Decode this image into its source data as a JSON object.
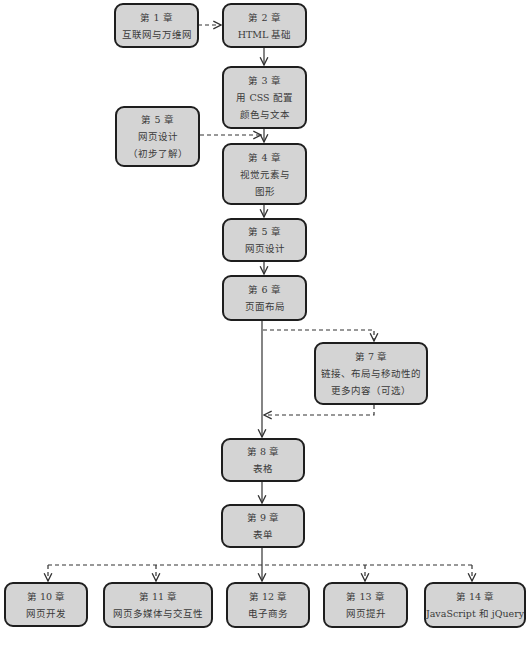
{
  "diagram": {
    "type": "flowchart",
    "colors": {
      "box_fill": "#d4d4d4",
      "box_border": "#1e1e1e",
      "line": "#333333",
      "text": "#3a3a3a"
    },
    "nodes": [
      {
        "id": "ch1",
        "chapter": "第 1 章",
        "lines": [
          "互联网与万维网"
        ]
      },
      {
        "id": "ch2",
        "chapter": "第 2 章",
        "lines": [
          "HTML 基础"
        ]
      },
      {
        "id": "ch3",
        "chapter": "第 3 章",
        "lines": [
          "用 CSS 配置",
          "颜色与文本"
        ]
      },
      {
        "id": "ch5a",
        "chapter": "第 5 章",
        "lines": [
          "网页设计",
          "（初步了解）"
        ]
      },
      {
        "id": "ch4",
        "chapter": "第 4 章",
        "lines": [
          "视觉元素与",
          "图形"
        ]
      },
      {
        "id": "ch5",
        "chapter": "第 5 章",
        "lines": [
          "网页设计"
        ]
      },
      {
        "id": "ch6",
        "chapter": "第 6 章",
        "lines": [
          "页面布局"
        ]
      },
      {
        "id": "ch7",
        "chapter": "第 7 章",
        "lines": [
          "链接、布局与移动性的",
          "更多内容（可选）"
        ]
      },
      {
        "id": "ch8",
        "chapter": "第 8 章",
        "lines": [
          "表格"
        ]
      },
      {
        "id": "ch9",
        "chapter": "第 9 章",
        "lines": [
          "表单"
        ]
      },
      {
        "id": "ch10",
        "chapter": "第 10 章",
        "lines": [
          "网页开发"
        ]
      },
      {
        "id": "ch11",
        "chapter": "第 11 章",
        "lines": [
          "网页多媒体与交互性"
        ]
      },
      {
        "id": "ch12",
        "chapter": "第 12 章",
        "lines": [
          "电子商务"
        ]
      },
      {
        "id": "ch13",
        "chapter": "第 13 章",
        "lines": [
          "网页提升"
        ]
      },
      {
        "id": "ch14",
        "chapter": "第 14 章",
        "lines": [
          "JavaScript 和  jQuery"
        ]
      }
    ],
    "edges": [
      {
        "from": "ch1",
        "to": "ch2",
        "style": "dashed"
      },
      {
        "from": "ch2",
        "to": "ch3",
        "style": "solid"
      },
      {
        "from": "ch3",
        "to": "ch4",
        "style": "solid"
      },
      {
        "from": "ch5a",
        "to": "ch4",
        "style": "dashed"
      },
      {
        "from": "ch4",
        "to": "ch5",
        "style": "solid"
      },
      {
        "from": "ch5",
        "to": "ch6",
        "style": "solid"
      },
      {
        "from": "ch6",
        "to": "ch7",
        "style": "dashed"
      },
      {
        "from": "ch7",
        "to": "ch8",
        "style": "dashed"
      },
      {
        "from": "ch6",
        "to": "ch8",
        "style": "solid"
      },
      {
        "from": "ch8",
        "to": "ch9",
        "style": "solid"
      },
      {
        "from": "ch9",
        "to": "ch10",
        "style": "dashed"
      },
      {
        "from": "ch9",
        "to": "ch11",
        "style": "dashed"
      },
      {
        "from": "ch9",
        "to": "ch12",
        "style": "solid"
      },
      {
        "from": "ch9",
        "to": "ch13",
        "style": "dashed"
      },
      {
        "from": "ch9",
        "to": "ch14",
        "style": "dashed"
      }
    ]
  }
}
